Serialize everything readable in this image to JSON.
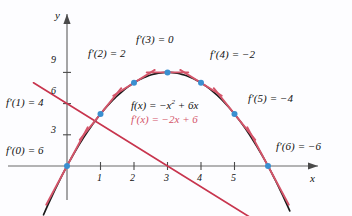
{
  "figure": {
    "background_color": "#fdfdff",
    "curve_color": "#1a1a1a",
    "derivative_color": "#c8354e",
    "tangent_color": "#d4556a",
    "point_color": "#3a8fd0",
    "axis_color": "#6b6b6b"
  },
  "axes": {
    "x_label": "x",
    "y_label": "y",
    "x_ticks": [
      "1",
      "2",
      "3",
      "4",
      "5"
    ],
    "y_ticks": [
      "3",
      "6",
      "9"
    ],
    "x_range": [
      -1.1,
      7.6
    ],
    "y_range": [
      -4.2,
      11.5
    ]
  },
  "equations": {
    "function": "f(x) = −x² + 6x",
    "function_base": "f(x) = −x",
    "function_exp": "2",
    "function_tail": " + 6x",
    "derivative": "f′(x) = −2x + 6"
  },
  "annotations": [
    {
      "label": "f′(0) = 6",
      "x": 0,
      "slope": 6
    },
    {
      "label": "f′(1) = 4",
      "x": 1,
      "slope": 4
    },
    {
      "label": "f′(2) = 2",
      "x": 2,
      "slope": 2
    },
    {
      "label": "f′(3) = 0",
      "x": 3,
      "slope": 0
    },
    {
      "label": "f′(4) = −2",
      "x": 4,
      "slope": -2
    },
    {
      "label": "f′(5) = −4",
      "x": 5,
      "slope": -4
    },
    {
      "label": "f′(6) = −6",
      "x": 6,
      "slope": -6
    }
  ],
  "chart_data": {
    "type": "line",
    "title": "",
    "xlabel": "x",
    "ylabel": "y",
    "xlim": [
      -1.1,
      7.6
    ],
    "ylim": [
      -4.2,
      11.5
    ],
    "grid": false,
    "legend": "none",
    "xticks": [
      1,
      2,
      3,
      4,
      5
    ],
    "yticks": [
      3,
      6,
      9
    ],
    "series": [
      {
        "name": "f(x) = -x^2 + 6x",
        "type": "curve",
        "color": "#1a1a1a",
        "expression": "-x^2 + 6x",
        "x": [
          -1,
          -0.5,
          0,
          0.5,
          1,
          1.5,
          2,
          2.5,
          3,
          3.5,
          4,
          4.5,
          5,
          5.5,
          6,
          6.5,
          7
        ],
        "y": [
          -7,
          -3.25,
          0,
          2.75,
          5,
          6.75,
          8,
          8.75,
          9,
          8.75,
          8,
          6.75,
          5,
          2.75,
          0,
          -3.25,
          -7
        ]
      },
      {
        "name": "f'(x) = -2x + 6",
        "type": "line",
        "color": "#c8354e",
        "expression": "-2x + 6",
        "x": [
          0,
          1,
          2,
          3,
          4,
          5,
          6
        ],
        "y": [
          6,
          4,
          2,
          0,
          -2,
          -4,
          -6
        ]
      }
    ],
    "points": [
      {
        "x": 0,
        "y": 0,
        "slope": 6,
        "label": "f'(0) = 6"
      },
      {
        "x": 1,
        "y": 5,
        "slope": 4,
        "label": "f'(1) = 4"
      },
      {
        "x": 2,
        "y": 8,
        "slope": 2,
        "label": "f'(2) = 2"
      },
      {
        "x": 3,
        "y": 9,
        "slope": 0,
        "label": "f'(3) = 0"
      },
      {
        "x": 4,
        "y": 8,
        "slope": -2,
        "label": "f'(4) = -2"
      },
      {
        "x": 5,
        "y": 5,
        "slope": -4,
        "label": "f'(5) = -4"
      },
      {
        "x": 6,
        "y": 0,
        "slope": -6,
        "label": "f'(6) = -6"
      }
    ],
    "annotation_texts": [
      "f'(0) = 6",
      "f'(1) = 4",
      "f'(2) = 2",
      "f'(3) = 0",
      "f'(4) = -2",
      "f'(5) = -4",
      "f'(6) = -6",
      "f(x) = -x^2 + 6x",
      "f'(x) = -2x + 6"
    ]
  },
  "labels": {
    "d0": "f′(0) = 6",
    "d1": "f′(1) = 4",
    "d2": "f′(2) = 2",
    "d3": "f′(3) = 0",
    "d4": "f′(4) = −2",
    "d5": "f′(5) = −4",
    "d6": "f′(6) = −6",
    "y3": "3",
    "y6": "6",
    "y9": "9",
    "x1": "1",
    "x2": "2",
    "x3": "3",
    "x4": "4",
    "x5": "5",
    "axis_x": "x",
    "axis_y": "y"
  }
}
